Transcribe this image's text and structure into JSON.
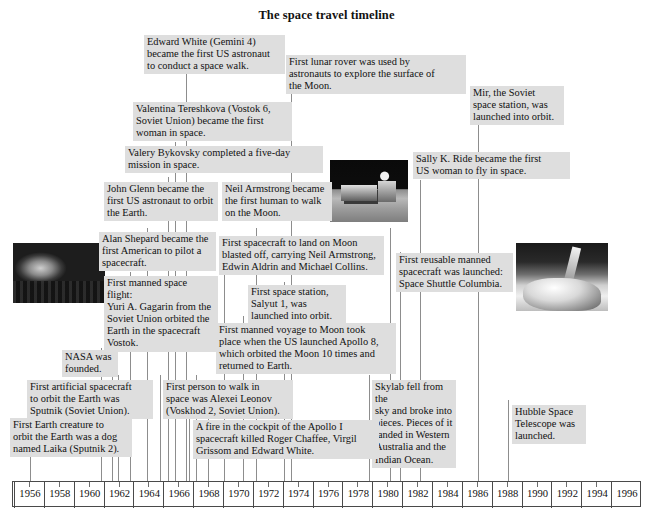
{
  "title": "The space travel timeline",
  "axis": {
    "start_year": 1956,
    "end_year": 1996,
    "tick_step": 2,
    "minor_step": 1,
    "labels": [
      "1956",
      "1958",
      "1960",
      "1962",
      "1964",
      "1966",
      "1968",
      "1970",
      "1972",
      "1974",
      "1976",
      "1978",
      "1980",
      "1982",
      "1984",
      "1986",
      "1988",
      "1990",
      "1992",
      "1994",
      "1996"
    ]
  },
  "chart_data": {
    "type": "table",
    "title": "The space travel timeline",
    "xlabel": "",
    "ylabel": "",
    "xlim": [
      1956,
      1996
    ],
    "grid": false,
    "legend": "none",
    "categories": [
      "1957",
      "1957",
      "1958",
      "1959",
      "1961",
      "1961",
      "1962",
      "1963",
      "1963",
      "1965",
      "1965",
      "1967",
      "1968",
      "1969",
      "1969",
      "1971",
      "1971",
      "1979",
      "1981",
      "1983",
      "1986",
      "1990"
    ],
    "events": [
      {
        "year": 1957,
        "text": "First artificial spacecraft to orbit the Earth was Sputnik (Soviet Union)."
      },
      {
        "year": 1957,
        "text": "First Earth creature to orbit the Earth was a dog named Laika (Sputnik 2)."
      },
      {
        "year": 1958,
        "text": "NASA was founded."
      },
      {
        "year": 1961,
        "text": "First manned space flight: Yuri A. Gagarin from the Soviet Union orbited the Earth in the spacecraft Vostok."
      },
      {
        "year": 1961,
        "text": "Alan Shepard became the first American to pilot a spacecraft."
      },
      {
        "year": 1962,
        "text": "John Glenn became the first US astronaut to orbit the Earth."
      },
      {
        "year": 1963,
        "text": "Valery Bykovsky completed a five-day mission in space."
      },
      {
        "year": 1963,
        "text": "Valentina Tereshkova (Vostok 6, Soviet Union) became the first woman in space."
      },
      {
        "year": 1965,
        "text": "First person to walk in space was Alexei Leonov (Voskhod 2, Soviet Union)."
      },
      {
        "year": 1965,
        "text": "Edward White (Gemini 4) became the first US astronaut to conduct a space walk."
      },
      {
        "year": 1967,
        "text": "A fire in the cockpit of the Apollo I spacecraft killed Roger Chaffee, Virgil Grissom and Edward White."
      },
      {
        "year": 1968,
        "text": "First manned voyage to Moon took place when the US launched Apollo 8, which orbited the Moon 10 times and returned to Earth."
      },
      {
        "year": 1969,
        "text": "First spacecraft to land on Moon blasted off, carrying Neil Armstrong, Edwin Aldrin and Michael Collins."
      },
      {
        "year": 1969,
        "text": "Neil Armstrong became the first human to walk on the Moon."
      },
      {
        "year": 1971,
        "text": "First space station, Salyut 1, was launched into orbit."
      },
      {
        "year": 1971,
        "text": "First lunar rover was used by astronauts to explore the surface of the Moon."
      },
      {
        "year": 1979,
        "text": "Skylab fell from the sky and broke into pieces. Pieces of it landed in Western Australia and the Indian Ocean."
      },
      {
        "year": 1981,
        "text": "First reusable manned spacecraft was launched: Space Shuttle Columbia."
      },
      {
        "year": 1983,
        "text": "Sally K. Ride became the first US woman to fly in space."
      },
      {
        "year": 1986,
        "text": "Mir, the Soviet space station, was launched into orbit."
      },
      {
        "year": 1990,
        "text": "Hubble Space Telescope was launched."
      }
    ]
  },
  "events": {
    "edward_white": "Edward White (Gemini 4)\nbecame the first US astronaut\nto conduct a space walk.",
    "lunar_rover": "First lunar rover was used by\nastronauts to explore the surface of\nthe Moon.",
    "mir": "Mir, the Soviet\nspace station, was\nlaunched into orbit.",
    "tereshkova": "Valentina Tereshkova (Vostok 6,\nSoviet Union) became the first\nwoman in space.",
    "bykovsky": "Valery Bykovsky completed a five-day\nmission in space.",
    "sally_ride": "Sally K. Ride became the first\nUS woman to fly in space.",
    "john_glenn": "John Glenn became the\nfirst US astronaut to orbit\nthe Earth.",
    "armstrong": "Neil Armstrong became\nthe first human to walk\non the Moon.",
    "shepard": "Alan Shepard became the\nfirst American to pilot a\nspacecraft.",
    "apollo11": "First spacecraft to land on Moon\nblasted off, carrying Neil Armstrong,\nEdwin Aldrin and Michael Collins.",
    "gagarin": "First manned space flight:\nYuri A. Gagarin from the\nSoviet Union orbited the\nEarth in the spacecraft\nVostok.",
    "salyut": "First space station,\nSalyut 1, was\nlaunched into orbit.",
    "columbia": "First reusable manned\nspacecraft was launched:\nSpace Shuttle Columbia.",
    "apollo8": "First manned voyage to Moon took\nplace when the US launched Apollo 8,\nwhich orbited the Moon 10 times and\nreturned to Earth.",
    "nasa": "NASA was\nfounded.",
    "sputnik": "First artificial spacecraft\nto orbit the Earth was\nSputnik (Soviet Union).",
    "leonov": "First person to walk in\nspace was Alexei Leonov\n(Voskhod 2, Soviet Union).",
    "skylab": "Skylab fell from the\nsky and broke into\npieces. Pieces of it\nlanded in Western\nAustralia and the\nIndian Ocean.",
    "hubble": "Hubble Space\nTelescope was\nlaunched.",
    "laika": "First Earth creature to\norbit the Earth was a dog\nnamed Laika (Sputnik 2).",
    "apollo1": "A fire in the cockpit of the Apollo I\nspacecraft killed Roger Chaffee, Virgil\nGrissom and Edward White."
  },
  "photos": {
    "sputnik_photo": "sputnik-satellite-photo",
    "rover_photo": "lunar-rover-moon-surface-photo",
    "shuttle_photo": "space-shuttle-launch-photo"
  },
  "colors": {
    "box_fill": "#dedede",
    "text": "#111111",
    "axis_line": "#4a4a4a",
    "leader_line": "#9a9a9a",
    "background": "#ffffff"
  }
}
